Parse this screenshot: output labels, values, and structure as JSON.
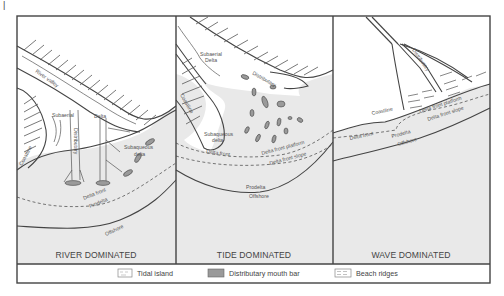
{
  "figure": {
    "corner_glyph": "|",
    "panels": [
      {
        "title": "RIVER DOMINATED",
        "labels": {
          "river_valley": "River valley",
          "subaerial": "Subaerial",
          "delta": "Delta",
          "distributary": "Distributary",
          "subaqueous_1": "Subaqueous",
          "subaqueous_2": "delta",
          "coastline": "Coastline",
          "delta_front": "Delta front",
          "prodelta": "Prodelta",
          "offshore": "Offshore"
        }
      },
      {
        "title": "TIDE DOMINATED",
        "labels": {
          "subaerial_1": "Subaerial",
          "subaerial_2": "Delta",
          "distributary": "Distributary",
          "coastline": "Coastline",
          "subaqueous_1": "Subaqueous",
          "subaqueous_2": "delta",
          "delta_front": "Delta front",
          "delta_front_platform": "Delta front platform",
          "delta_front_slope": "Delta front slope",
          "prodelta": "Prodelta",
          "offshore": "Offshore"
        }
      },
      {
        "title": "WAVE DOMINATED",
        "labels": {
          "distributary": "Distributary",
          "coastline": "Coastline",
          "delta_front_platform": "Delta front platform",
          "delta_front_slope": "Delta front slope",
          "delta_front": "Delta front",
          "prodelta": "Prodelta",
          "offshore": "Offshore"
        }
      }
    ],
    "legend": [
      {
        "label": "Tidal island",
        "swatch": "tidal-island"
      },
      {
        "label": "Distributary mouth bar",
        "swatch": "mouth-bar"
      },
      {
        "label": "Beach ridges",
        "swatch": "beach-ridges"
      }
    ],
    "colors": {
      "sea": "#e9e9e9",
      "land": "#ffffff",
      "line": "#444444",
      "mouth_bar": "#9a9a9a"
    }
  }
}
